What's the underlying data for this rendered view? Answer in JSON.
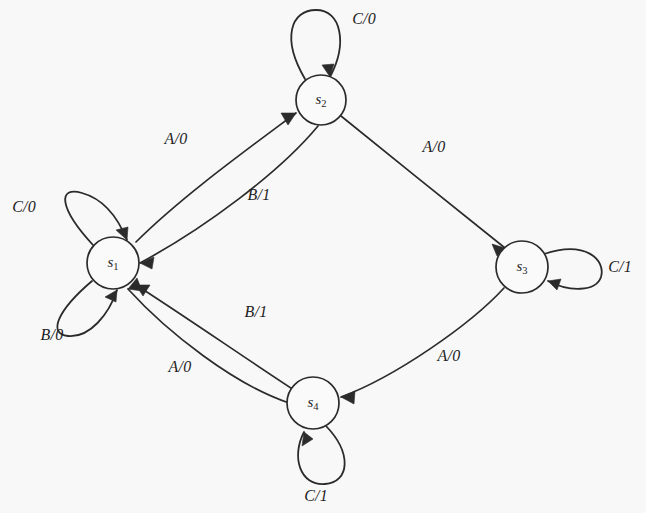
{
  "diagram": {
    "kind": "finite-state-machine",
    "background_color": "#f9f8f8",
    "stroke_color": "#2b2b2b",
    "node_fill_color": "#fbfafa",
    "states": [
      {
        "id": "s1",
        "name": "s",
        "subscript": "1",
        "cx": 113,
        "cy": 263,
        "r": 26
      },
      {
        "id": "s2",
        "name": "s",
        "subscript": "2",
        "cx": 321,
        "cy": 100,
        "r": 25
      },
      {
        "id": "s3",
        "name": "s",
        "subscript": "3",
        "cx": 522,
        "cy": 267,
        "r": 26
      },
      {
        "id": "s4",
        "name": "s",
        "subscript": "4",
        "cx": 313,
        "cy": 403,
        "r": 26
      }
    ],
    "transitions": [
      {
        "from": "s1",
        "to": "s2",
        "input": "A",
        "output": "0",
        "label": "A/0",
        "label_x": 176,
        "label_y": 140
      },
      {
        "from": "s2",
        "to": "s1",
        "input": "B",
        "output": "1",
        "label": "B/1",
        "label_x": 259,
        "label_y": 196
      },
      {
        "from": "s2",
        "to": "s3",
        "input": "A",
        "output": "0",
        "label": "A/0",
        "label_x": 434,
        "label_y": 148
      },
      {
        "from": "s3",
        "to": "s4",
        "input": "A",
        "output": "0",
        "label": "A/0",
        "label_x": 449,
        "label_y": 357
      },
      {
        "from": "s4",
        "to": "s1",
        "input": "B",
        "output": "1",
        "label": "B/1",
        "label_x": 256,
        "label_y": 313
      },
      {
        "from": "s4",
        "to": "s1",
        "input": "A",
        "output": "0",
        "label": "A/0",
        "label_x": 180,
        "label_y": 368
      },
      {
        "from": "s1",
        "to": "s1",
        "input": "C",
        "output": "0",
        "label": "C/0",
        "label_x": 24,
        "label_y": 208,
        "self_loop": true,
        "loop_side": "upper-left"
      },
      {
        "from": "s1",
        "to": "s1",
        "input": "B",
        "output": "0",
        "label": "B/0",
        "label_x": 52,
        "label_y": 336,
        "self_loop": true,
        "loop_side": "lower-left"
      },
      {
        "from": "s2",
        "to": "s2",
        "input": "C",
        "output": "0",
        "label": "C/0",
        "label_x": 364,
        "label_y": 20,
        "self_loop": true,
        "loop_side": "top"
      },
      {
        "from": "s3",
        "to": "s3",
        "input": "C",
        "output": "1",
        "label": "C/1",
        "label_x": 620,
        "label_y": 268,
        "self_loop": true,
        "loop_side": "right"
      },
      {
        "from": "s4",
        "to": "s4",
        "input": "C",
        "output": "1",
        "label": "C/1",
        "label_x": 316,
        "label_y": 497,
        "self_loop": true,
        "loop_side": "bottom"
      }
    ]
  }
}
